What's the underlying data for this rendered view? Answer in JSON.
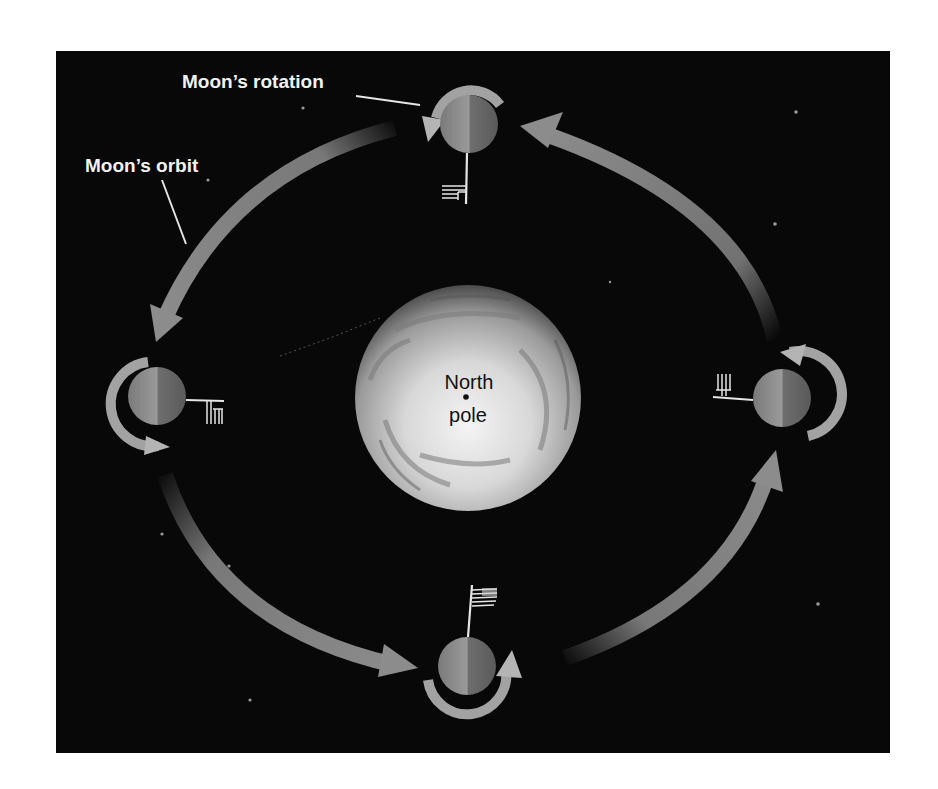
{
  "diagram": {
    "type": "moon-orbit-rotation",
    "background_color": "#080808",
    "panel": {
      "x": 56,
      "y": 51,
      "width": 834,
      "height": 702
    },
    "colors": {
      "arrow": "#8c8c8c",
      "rotation_arrow": "#b4b4b4",
      "label": "#f2f2f2",
      "leader_line": "#e6e6e6",
      "pole_label": "#111111",
      "star": "#9a9a9a"
    },
    "labels": {
      "moon_rotation": "Moon’s rotation",
      "moon_orbit": "Moon’s orbit",
      "north": "North",
      "pole": "pole"
    },
    "earth": {
      "cx": 468,
      "cy": 398,
      "r": 113,
      "label_lines": [
        "North",
        "pole"
      ]
    },
    "moons": [
      {
        "id": "top",
        "cx": 469,
        "cy": 124,
        "r": 29,
        "flag_direction": "down"
      },
      {
        "id": "left",
        "cx": 157,
        "cy": 396,
        "r": 29,
        "flag_direction": "right"
      },
      {
        "id": "bottom",
        "cx": 467,
        "cy": 666,
        "r": 29,
        "flag_direction": "up"
      },
      {
        "id": "right",
        "cx": 782,
        "cy": 398,
        "r": 29,
        "flag_direction": "left"
      }
    ],
    "orbit_direction": "counterclockwise",
    "orbit_arrows": 4,
    "stars": [
      [
        303,
        108
      ],
      [
        208,
        180
      ],
      [
        796,
        112
      ],
      [
        775,
        224
      ],
      [
        610,
        282
      ],
      [
        162,
        534
      ],
      [
        229,
        566
      ],
      [
        250,
        700
      ],
      [
        818,
        604
      ],
      [
        420,
        360
      ]
    ]
  }
}
